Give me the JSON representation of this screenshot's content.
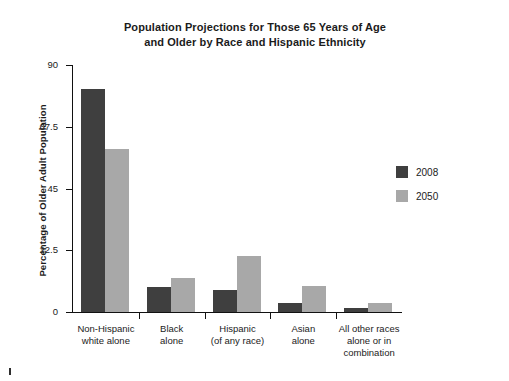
{
  "chart_data": {
    "type": "bar",
    "title": "Population Projections for Those 65 Years of Age and Older by Race and Hispanic Ethnicity",
    "title_lines": [
      "Population Projections for Those 65 Years of Age",
      "and Older by Race and Hispanic Ethnicity"
    ],
    "xlabel": "",
    "ylabel": "Percentage of Older Adult Population",
    "ylim": [
      0,
      90
    ],
    "yticks": [
      0,
      22.5,
      45,
      67.5,
      90
    ],
    "ytick_labels": [
      "0",
      "22.5",
      "45",
      "67.5",
      "90"
    ],
    "grid": false,
    "legend_position": "right",
    "categories": [
      "Non-Hispanic white alone",
      "Black alone",
      "Hispanic (of any race)",
      "Asian alone",
      "All other races alone or in combination"
    ],
    "category_label_lines": [
      [
        "Non-Hispanic",
        "white alone"
      ],
      [
        "Black",
        "alone"
      ],
      [
        "Hispanic",
        "(of any race)"
      ],
      [
        "Asian",
        "alone"
      ],
      [
        "All other races",
        "alone or in",
        "combination"
      ]
    ],
    "series": [
      {
        "name": "2008",
        "color": "#3f3f3f",
        "values": [
          81.2,
          9.1,
          8.0,
          3.3,
          1.5
        ]
      },
      {
        "name": "2050",
        "color": "#a8a8a8",
        "values": [
          59.4,
          12.4,
          20.4,
          9.5,
          3.3
        ]
      }
    ]
  },
  "legend": {
    "items": [
      {
        "label": "2008",
        "color": "#3f3f3f"
      },
      {
        "label": "2050",
        "color": "#a8a8a8"
      }
    ]
  }
}
